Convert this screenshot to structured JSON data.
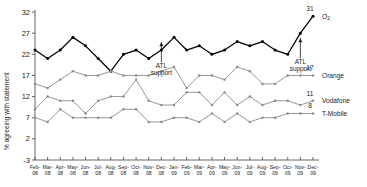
{
  "chart_data": {
    "type": "line",
    "title": "",
    "xlabel": "",
    "ylabel": "% agreeing with statement",
    "ylim": [
      -3,
      32
    ],
    "yticks": [
      -3,
      2,
      7,
      12,
      17,
      22,
      27,
      32
    ],
    "grid": false,
    "legend_position": "right-inline",
    "categories": [
      "Feb-08",
      "Mar-08",
      "Apr-08",
      "May-08",
      "Jun-08",
      "Jul-08",
      "Aug-08",
      "Sep-08",
      "Oct-08",
      "Nov-08",
      "Dec-08",
      "Jan-09",
      "Feb-09",
      "Mar-09",
      "Apr-09",
      "May-09",
      "Jun-09",
      "Jul-09",
      "Aug-09",
      "Sep-09",
      "Oct-09",
      "Nov-09",
      "Dec-09"
    ],
    "category_months": [
      "Feb-",
      "Mar-",
      "Apr-",
      "May-",
      "Jun-",
      "Jul-",
      "Aug-",
      "Sep-",
      "Oct-",
      "Nov-",
      "Dec-",
      "Jan-",
      "Feb-",
      "Mar-",
      "Apr-",
      "May-",
      "Jun-",
      "Jul-",
      "Aug-",
      "Sep-",
      "Oct-",
      "Nov-",
      "Dec-"
    ],
    "category_years": [
      "08",
      "08",
      "08",
      "08",
      "08",
      "08",
      "08",
      "08",
      "08",
      "08",
      "08",
      "09",
      "09",
      "09",
      "09",
      "09",
      "09",
      "09",
      "09",
      "09",
      "09",
      "09",
      "09"
    ],
    "series": [
      {
        "name": "O2",
        "label": "O",
        "label_sub": "2",
        "end_value": "31",
        "color": "#000000",
        "values": [
          23,
          21,
          23,
          26,
          24,
          21,
          18,
          22,
          23,
          21,
          23,
          26,
          23,
          24,
          22,
          23,
          25,
          24,
          25,
          23,
          22,
          27,
          31
        ]
      },
      {
        "name": "Orange",
        "label": "Orange",
        "end_value": "17",
        "color": "#8a8a8a",
        "values": [
          15,
          14,
          16,
          18,
          17,
          17,
          18,
          17,
          17,
          17,
          18,
          19,
          14,
          17,
          17,
          16,
          19,
          18,
          15,
          15,
          17,
          17,
          17
        ]
      },
      {
        "name": "Vodafone",
        "label": "Vodafone",
        "end_value": "11",
        "color": "#8a8a8a",
        "values": [
          9,
          12,
          11,
          11,
          8,
          11,
          12,
          12,
          16,
          11,
          10,
          10,
          13,
          13,
          10,
          13,
          10,
          12,
          10,
          11,
          11,
          10,
          11
        ]
      },
      {
        "name": "T-Mobile",
        "label": "T-Mobile",
        "end_value": "8",
        "color": "#8a8a8a",
        "values": [
          7,
          6,
          9,
          7,
          7,
          7,
          7,
          9,
          9,
          6,
          6,
          7,
          7,
          6,
          8,
          6,
          8,
          6,
          7,
          7,
          8,
          8,
          8
        ]
      }
    ],
    "annotations": [
      {
        "text_line1": "ATL",
        "text_line2": "support",
        "at_category": "Dec-08",
        "at_value": 26
      },
      {
        "text_line1": "ATL",
        "text_line2": "support",
        "at_category": "Nov-09",
        "at_value": 27
      }
    ]
  }
}
